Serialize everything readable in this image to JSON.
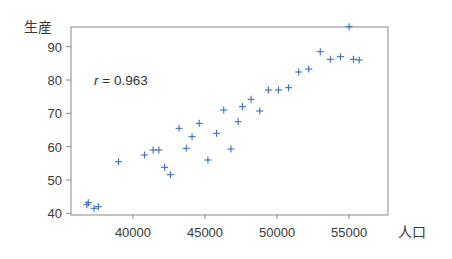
{
  "chart_data": {
    "type": "scatter",
    "title": "",
    "xlabel": "人口",
    "ylabel": "生産",
    "xlim": [
      35700,
      57700
    ],
    "ylim": [
      39.5,
      95.9
    ],
    "x_ticks": [
      40000,
      45000,
      50000,
      55000
    ],
    "y_ticks": [
      40,
      50,
      60,
      70,
      80,
      90
    ],
    "grid": false,
    "legend": null,
    "annotation": {
      "text_var": "r",
      "text_rest": " = 0.963",
      "value": 0.963
    },
    "marker": "+",
    "marker_color": "#3b6fc0",
    "points": [
      [
        36800,
        42.6
      ],
      [
        36900,
        43.2
      ],
      [
        37300,
        41.5
      ],
      [
        37600,
        42.0
      ],
      [
        39000,
        55.5
      ],
      [
        40800,
        57.5
      ],
      [
        41400,
        59.0
      ],
      [
        41800,
        59.0
      ],
      [
        42200,
        53.8
      ],
      [
        42600,
        51.6
      ],
      [
        43200,
        65.5
      ],
      [
        43700,
        59.5
      ],
      [
        44100,
        63.0
      ],
      [
        44600,
        67.0
      ],
      [
        45200,
        56.0
      ],
      [
        45800,
        64.0
      ],
      [
        46300,
        71.0
      ],
      [
        46800,
        59.3
      ],
      [
        47300,
        67.5
      ],
      [
        47600,
        72.0
      ],
      [
        48200,
        74.2
      ],
      [
        48800,
        70.7
      ],
      [
        49400,
        77.0
      ],
      [
        50100,
        77.0
      ],
      [
        50800,
        77.7
      ],
      [
        51500,
        82.4
      ],
      [
        52200,
        83.3
      ],
      [
        53000,
        88.5
      ],
      [
        53700,
        86.2
      ],
      [
        54400,
        87.0
      ],
      [
        55000,
        96.0
      ],
      [
        55300,
        86.2
      ],
      [
        55700,
        86.0
      ]
    ]
  }
}
